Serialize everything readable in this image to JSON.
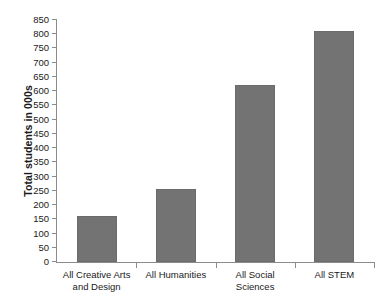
{
  "chart_data": {
    "type": "bar",
    "title": "",
    "xlabel": "",
    "ylabel": "Total students in 000s",
    "categories": [
      "All Creative Arts and Design",
      "All Humanities",
      "All Social Sciences",
      "All STEM"
    ],
    "values": [
      163,
      257,
      620,
      810
    ],
    "ylim": [
      0,
      850
    ],
    "ytick_step": 50,
    "yticks": [
      0,
      50,
      100,
      150,
      200,
      250,
      300,
      350,
      400,
      450,
      500,
      550,
      600,
      650,
      700,
      750,
      800,
      850
    ],
    "ytick_labels": [
      "0",
      "50",
      "100",
      "150",
      "200",
      "250",
      "300",
      "350",
      "400",
      "450",
      "500",
      "550",
      "600",
      "650",
      "700",
      "750",
      "800",
      "850"
    ],
    "grid": false,
    "legend": false,
    "legend_position": "none",
    "bar_color": "#737373",
    "bar_edge_color": "#6b6b6b",
    "axis_color": "#8c8c8c",
    "background_color": "#ffffff",
    "text_color": "#1a1a1a"
  },
  "category_lines": [
    [
      "All Creative Arts",
      "and Design"
    ],
    [
      "All Humanities"
    ],
    [
      "All Social",
      "Sciences"
    ],
    [
      "All STEM"
    ]
  ]
}
